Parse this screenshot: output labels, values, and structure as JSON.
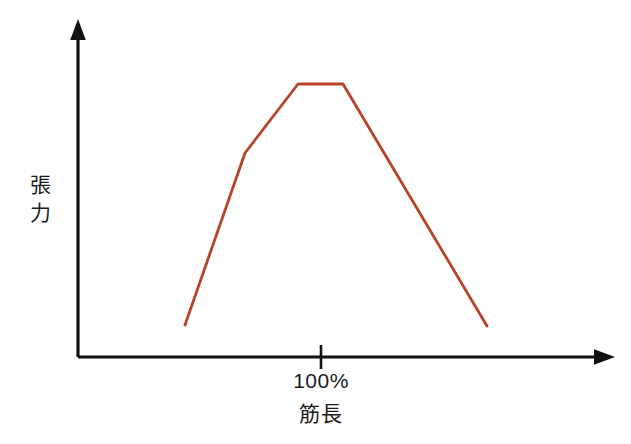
{
  "chart_data": {
    "type": "line",
    "title": "",
    "subtitle": "",
    "xlabel": "筋長",
    "ylabel": "張力",
    "ylabel_chars": [
      "張",
      "力"
    ],
    "x_tick_labels": [
      "100%"
    ],
    "x_tick_values": [
      100
    ],
    "y_tick_labels": [],
    "grid": false,
    "legend": null,
    "legend_position": "none",
    "annotations": [],
    "xlim": [
      55,
      170
    ],
    "ylim": [
      0,
      1.12
    ],
    "axis_style": "arrow-ended open axes",
    "series": [
      {
        "name": "length-tension",
        "color": "#b8432a",
        "x": [
          75,
          95,
          112,
          127,
          175
        ],
        "y": [
          0.18,
          0.73,
          0.95,
          0.95,
          0.175
        ],
        "points_px": [
          [
            185,
            325
          ],
          [
            245,
            153
          ],
          [
            298,
            84
          ],
          [
            343,
            84
          ],
          [
            487,
            326
          ]
        ]
      }
    ]
  },
  "figure": {
    "background_color": "#ffffff",
    "axis_color": "#111111",
    "curve_color": "#b8432a",
    "width": 631,
    "height": 444
  },
  "axes": {
    "x_axis_name": "horizontal-axis",
    "y_axis_name": "vertical-axis",
    "tick": {
      "label": "100%",
      "position_px": 321
    }
  },
  "labels": {
    "y_axis_label": "張力",
    "y_axis_label_line1": "張",
    "y_axis_label_line2": "力",
    "x_axis_label": "筋長",
    "x_tick_label": "100%"
  }
}
